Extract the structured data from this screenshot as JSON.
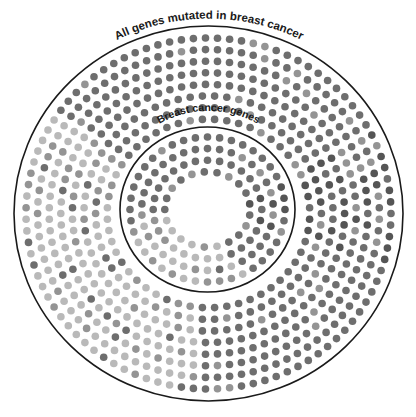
{
  "diagram": {
    "outer_label": "All genes mutated in breast cancer",
    "inner_label": "Breast cancer genes",
    "outer_circle": {
      "cx": 208.5,
      "cy": 213.5,
      "rx": 194.5,
      "ry": 187.5
    },
    "inner_circle": {
      "cx": 207.5,
      "cy": 209.5,
      "rx": 87.5,
      "ry": 82.5
    },
    "line_color": "#1a1a1a",
    "dot_colors": {
      "dark": "#6e6e6e",
      "darker": "#555555",
      "light": "#b9b9b9",
      "mid": "#949494"
    },
    "dot_radius": 3.8,
    "dot_spacing": 11.8,
    "outer_rings": {
      "count": 8,
      "start_inset": 12,
      "step": 11.6
    },
    "inner_rings": {
      "count": 4,
      "start_inset": 10,
      "step": 11.6
    },
    "regions": {
      "outer_light_sector_deg": [
        95,
        215
      ],
      "outer_dark_sector_deg": [
        330,
        380
      ],
      "inner_light_sector_deg": [
        60,
        170
      ],
      "inner_dark_sector_deg": [
        340,
        380
      ]
    }
  }
}
